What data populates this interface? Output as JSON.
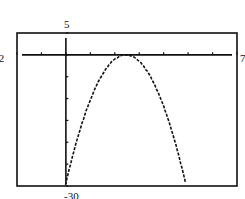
{
  "chart_data": {
    "type": "line",
    "title": "",
    "xlabel": "",
    "ylabel": "",
    "xlim": [
      -2,
      7
    ],
    "ylim": [
      -30,
      5
    ],
    "xscl": 1,
    "yscl": 5,
    "grid": false,
    "legend": null,
    "window_labels": {
      "ymax": "5",
      "xmin": "-2",
      "xmax": "7",
      "ymin": "-30"
    },
    "series": [
      {
        "name": "parabola",
        "equation": "y = -4.9x^2 + 24x - 29.4",
        "x": [
          -0.05,
          0.5,
          1.0,
          1.5,
          1.9,
          2.45,
          2.85,
          3.5,
          4.0,
          4.5,
          5.0
        ],
        "y": [
          -30,
          -18.6,
          -10.3,
          -4.4,
          -1.5,
          0,
          -0.8,
          -5.4,
          -11.8,
          -20.6,
          -30
        ]
      }
    ]
  }
}
